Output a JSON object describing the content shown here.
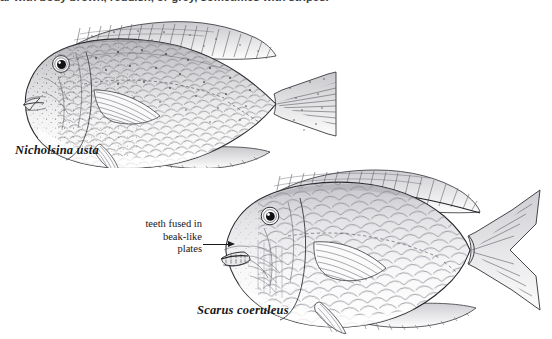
{
  "page": {
    "background_color": "#ffffff",
    "ink_color": "#1b1b1d",
    "width": 552,
    "height": 339
  },
  "caption": {
    "text": "ar with body brown, reddish, or grey, sometimes with stripes.",
    "note": "partially cropped text line at top edge of page"
  },
  "figures": [
    {
      "id": "nicholsina-usta",
      "species_label": "Nicholsina usta",
      "common_group": "parrotfish",
      "illustration_style": "pen-and-ink stipple line drawing",
      "orientation": "left-facing lateral view",
      "caudal_fin": "truncate",
      "label_position": {
        "x": 15,
        "y": 143
      }
    },
    {
      "id": "scarus-coeruleus",
      "species_label": "Scarus coeruleus",
      "common_group": "parrotfish",
      "illustration_style": "pen-and-ink line drawing",
      "orientation": "left-facing lateral view",
      "caudal_fin": "deeply forked with elongated lobes",
      "label_position": {
        "x": 197,
        "y": 303
      }
    }
  ],
  "annotation": {
    "lines": [
      "teeth fused in",
      "beak-like",
      "plates"
    ],
    "line1": "teeth fused in",
    "line2": "beak-like",
    "line3": "plates",
    "points_to": "scarus-coeruleus-mouth",
    "leader_style": "horizontal line with solid arrowhead"
  }
}
